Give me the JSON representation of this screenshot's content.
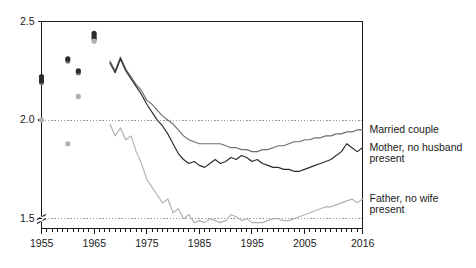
{
  "chart_data": {
    "type": "line",
    "title": "",
    "subtitle": "",
    "xlabel": "",
    "ylabel": "",
    "xlim": [
      1955,
      2016
    ],
    "ylim": [
      1.45,
      2.5
    ],
    "grid": "horizontal dotted gridlines at 2.0 and 1.5",
    "legend_position": "right-of-plot, aligned to series end values",
    "axis_break": "y-axis break below 1.45",
    "y_ticks": [
      "2.5",
      "2.0",
      "1.5"
    ],
    "y_tick_values": [
      2.5,
      2.0,
      1.5
    ],
    "x_ticks": [
      "1955",
      "1965",
      "1975",
      "1985",
      "1995",
      "2005",
      "2016"
    ],
    "x_tick_values": [
      1955,
      1965,
      1975,
      1985,
      1995,
      2005,
      2016
    ],
    "x_minor_tick_interval": 1,
    "colors": {
      "married_couple": "#6e6e6e",
      "mother_no_husband": "#2b2b2b",
      "father_no_wife": "#b0b0b0",
      "gridline": "#9a9a9a",
      "axis": "#1a1a1a"
    },
    "series": [
      {
        "name": "Married couple",
        "color": "#6e6e6e",
        "marker_points": [
          {
            "x": 1955,
            "y": 2.21
          },
          {
            "x": 1955,
            "y": 2.19
          },
          {
            "x": 1960,
            "y": 2.3
          },
          {
            "x": 1962,
            "y": 2.24
          },
          {
            "x": 1965,
            "y": 2.43
          },
          {
            "x": 1965,
            "y": 2.41
          }
        ],
        "x": [
          1968,
          1969,
          1970,
          1971,
          1972,
          1973,
          1974,
          1975,
          1976,
          1977,
          1978,
          1979,
          1980,
          1981,
          1982,
          1983,
          1984,
          1985,
          1986,
          1987,
          1988,
          1989,
          1990,
          1991,
          1992,
          1993,
          1994,
          1995,
          1996,
          1997,
          1998,
          1999,
          2000,
          2001,
          2002,
          2003,
          2004,
          2005,
          2006,
          2007,
          2008,
          2009,
          2010,
          2011,
          2012,
          2013,
          2014,
          2015,
          2016
        ],
        "y": [
          2.3,
          2.25,
          2.32,
          2.26,
          2.22,
          2.18,
          2.15,
          2.1,
          2.08,
          2.05,
          2.02,
          2.0,
          1.98,
          1.95,
          1.92,
          1.9,
          1.89,
          1.88,
          1.88,
          1.88,
          1.88,
          1.88,
          1.87,
          1.86,
          1.86,
          1.85,
          1.85,
          1.84,
          1.84,
          1.85,
          1.85,
          1.86,
          1.87,
          1.87,
          1.88,
          1.89,
          1.89,
          1.9,
          1.9,
          1.91,
          1.91,
          1.92,
          1.92,
          1.93,
          1.93,
          1.94,
          1.94,
          1.95,
          1.95
        ]
      },
      {
        "name": "Mother, no husband present",
        "color": "#2b2b2b",
        "marker_points": [
          {
            "x": 1955,
            "y": 2.22
          },
          {
            "x": 1955,
            "y": 2.2
          },
          {
            "x": 1960,
            "y": 2.31
          },
          {
            "x": 1962,
            "y": 2.25
          },
          {
            "x": 1965,
            "y": 2.44
          },
          {
            "x": 1965,
            "y": 2.42
          }
        ],
        "x": [
          1968,
          1969,
          1970,
          1971,
          1972,
          1973,
          1974,
          1975,
          1976,
          1977,
          1978,
          1979,
          1980,
          1981,
          1982,
          1983,
          1984,
          1985,
          1986,
          1987,
          1988,
          1989,
          1990,
          1991,
          1992,
          1993,
          1994,
          1995,
          1996,
          1997,
          1998,
          1999,
          2000,
          2001,
          2002,
          2003,
          2004,
          2005,
          2006,
          2007,
          2008,
          2009,
          2010,
          2011,
          2012,
          2013,
          2014,
          2015,
          2016
        ],
        "y": [
          2.29,
          2.24,
          2.31,
          2.25,
          2.21,
          2.17,
          2.13,
          2.08,
          2.04,
          2.0,
          1.97,
          1.93,
          1.88,
          1.83,
          1.8,
          1.78,
          1.79,
          1.77,
          1.76,
          1.78,
          1.8,
          1.78,
          1.79,
          1.81,
          1.8,
          1.82,
          1.81,
          1.79,
          1.8,
          1.78,
          1.77,
          1.76,
          1.76,
          1.75,
          1.75,
          1.74,
          1.74,
          1.75,
          1.76,
          1.77,
          1.78,
          1.79,
          1.8,
          1.82,
          1.84,
          1.88,
          1.86,
          1.84,
          1.86
        ]
      },
      {
        "name": "Father, no wife present",
        "color": "#b0b0b0",
        "marker_points": [
          {
            "x": 1955,
            "y": 2.0
          },
          {
            "x": 1960,
            "y": 1.88
          },
          {
            "x": 1962,
            "y": 2.12
          },
          {
            "x": 1965,
            "y": 2.4
          }
        ],
        "x": [
          1968,
          1969,
          1970,
          1971,
          1972,
          1973,
          1974,
          1975,
          1976,
          1977,
          1978,
          1979,
          1980,
          1981,
          1982,
          1983,
          1984,
          1985,
          1986,
          1987,
          1988,
          1989,
          1990,
          1991,
          1992,
          1993,
          1994,
          1995,
          1996,
          1997,
          1998,
          1999,
          2000,
          2001,
          2002,
          2003,
          2004,
          2005,
          2006,
          2007,
          2008,
          2009,
          2010,
          2011,
          2012,
          2013,
          2014,
          2015,
          2016
        ],
        "y": [
          1.98,
          1.92,
          1.96,
          1.9,
          1.92,
          1.84,
          1.78,
          1.7,
          1.66,
          1.62,
          1.58,
          1.6,
          1.53,
          1.55,
          1.5,
          1.52,
          1.48,
          1.49,
          1.48,
          1.5,
          1.49,
          1.48,
          1.49,
          1.52,
          1.51,
          1.49,
          1.5,
          1.48,
          1.48,
          1.48,
          1.49,
          1.5,
          1.5,
          1.49,
          1.49,
          1.5,
          1.51,
          1.52,
          1.53,
          1.54,
          1.55,
          1.56,
          1.56,
          1.57,
          1.58,
          1.59,
          1.6,
          1.58,
          1.6
        ]
      }
    ],
    "legend_labels": [
      {
        "id": "married-couple",
        "lines": [
          "Married couple"
        ]
      },
      {
        "id": "mother-no-husband",
        "lines": [
          "Mother, no husband",
          "present"
        ]
      },
      {
        "id": "father-no-wife",
        "lines": [
          "Father, no wife",
          "present"
        ]
      }
    ]
  }
}
